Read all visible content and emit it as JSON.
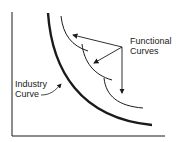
{
  "diagram": {
    "labels": {
      "functional": [
        "Functional",
        "Curves"
      ],
      "industry": [
        "Industry",
        "Curve"
      ]
    },
    "colors": {
      "line": "#1a1a1a",
      "background": "#ffffff"
    }
  }
}
